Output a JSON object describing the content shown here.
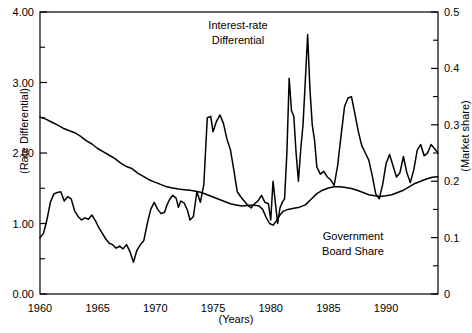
{
  "chart_data": {
    "type": "line",
    "title": "",
    "xlabel": "(Years)",
    "ylabel_left": "(Rate Differential)",
    "ylabel_right": "(Market share)",
    "xlim": [
      1960,
      1994.5
    ],
    "ylim_left": [
      0.0,
      4.0
    ],
    "ylim_right": [
      0.0,
      0.5
    ],
    "grid": false,
    "legend_position": "inline-annotations",
    "x_ticks": [
      "1960",
      "1965",
      "1970",
      "1975",
      "1980",
      "1985",
      "1990"
    ],
    "x_tick_values": [
      1960,
      1965,
      1970,
      1975,
      1980,
      1985,
      1990
    ],
    "y_ticks_left": [
      "0.00",
      "1.00",
      "2.00",
      "3.00",
      "4.00"
    ],
    "y_tick_values_left": [
      0.0,
      1.0,
      2.0,
      3.0,
      4.0
    ],
    "y_minor_ticks_left": [
      0.5,
      1.5,
      2.5,
      3.5
    ],
    "y_ticks_right": [
      "0",
      "0.1",
      "0.2",
      "0.3",
      "0.4",
      "0.5"
    ],
    "y_tick_values_right": [
      0.0,
      0.1,
      0.2,
      0.3,
      0.4,
      0.5
    ],
    "y_minor_ticks_right": [
      0.05,
      0.15,
      0.25,
      0.35,
      0.45
    ],
    "annotations": [
      {
        "name": "interest-rate-differential-label",
        "line1": "Interest-rate",
        "line2": "Differential"
      },
      {
        "name": "government-board-share-label",
        "line1": "Government",
        "line2": "Board Share"
      }
    ],
    "series": [
      {
        "name": "Interest-rate Differential",
        "axis": "left",
        "color": "#000000",
        "x": [
          1960.0,
          1960.3,
          1960.6,
          1960.9,
          1961.2,
          1961.5,
          1961.8,
          1962.1,
          1962.4,
          1962.7,
          1963.0,
          1963.3,
          1963.6,
          1963.9,
          1964.2,
          1964.5,
          1964.8,
          1965.1,
          1965.4,
          1965.7,
          1966.0,
          1966.3,
          1966.6,
          1966.9,
          1967.2,
          1967.5,
          1967.8,
          1968.1,
          1968.4,
          1968.7,
          1969.0,
          1969.3,
          1969.6,
          1969.9,
          1970.2,
          1970.5,
          1970.8,
          1971.0,
          1971.2,
          1971.5,
          1971.8,
          1972.0,
          1972.2,
          1972.5,
          1972.8,
          1973.0,
          1973.3,
          1973.6,
          1973.9,
          1974.2,
          1974.5,
          1974.8,
          1975.0,
          1975.3,
          1975.6,
          1975.9,
          1976.2,
          1976.5,
          1976.8,
          1977.1,
          1977.4,
          1977.7,
          1978.0,
          1978.3,
          1978.6,
          1978.9,
          1979.2,
          1979.5,
          1979.8,
          1980.0,
          1980.2,
          1980.4,
          1980.6,
          1980.8,
          1981.0,
          1981.2,
          1981.4,
          1981.6,
          1981.8,
          1982.0,
          1982.2,
          1982.4,
          1982.6,
          1982.8,
          1983.0,
          1983.2,
          1983.4,
          1983.6,
          1983.8,
          1984.0,
          1984.3,
          1984.6,
          1984.9,
          1985.2,
          1985.5,
          1985.8,
          1986.1,
          1986.4,
          1986.7,
          1987.0,
          1987.3,
          1987.6,
          1987.9,
          1988.2,
          1988.5,
          1988.8,
          1989.1,
          1989.4,
          1989.7,
          1990.0,
          1990.3,
          1990.6,
          1990.9,
          1991.2,
          1991.5,
          1991.8,
          1992.1,
          1992.4,
          1992.7,
          1993.0,
          1993.3,
          1993.6,
          1993.9,
          1994.2,
          1994.5
        ],
        "y": [
          0.8,
          0.86,
          1.05,
          1.3,
          1.42,
          1.44,
          1.45,
          1.32,
          1.38,
          1.35,
          1.18,
          1.1,
          1.05,
          1.08,
          1.06,
          1.12,
          1.04,
          0.94,
          0.86,
          0.78,
          0.72,
          0.7,
          0.65,
          0.68,
          0.64,
          0.7,
          0.6,
          0.45,
          0.62,
          0.7,
          0.76,
          1.0,
          1.2,
          1.3,
          1.2,
          1.14,
          1.16,
          1.26,
          1.33,
          1.4,
          1.36,
          1.23,
          1.32,
          1.29,
          1.18,
          1.05,
          1.1,
          1.45,
          1.3,
          1.55,
          2.5,
          2.52,
          2.3,
          2.45,
          2.54,
          2.42,
          2.2,
          2.05,
          1.76,
          1.45,
          1.38,
          1.32,
          1.26,
          1.22,
          1.28,
          1.32,
          1.4,
          1.3,
          1.28,
          1.05,
          1.6,
          1.3,
          1.0,
          1.22,
          1.3,
          1.35,
          2.0,
          3.06,
          2.6,
          2.52,
          2.0,
          1.6,
          2.05,
          2.4,
          3.03,
          3.68,
          2.9,
          2.4,
          2.18,
          1.8,
          1.7,
          1.74,
          1.66,
          1.62,
          1.54,
          1.82,
          2.25,
          2.66,
          2.78,
          2.8,
          2.55,
          2.3,
          2.1,
          2.0,
          1.9,
          1.68,
          1.42,
          1.35,
          1.55,
          1.85,
          1.98,
          1.82,
          1.66,
          1.72,
          1.95,
          1.72,
          1.58,
          1.76,
          2.04,
          2.12,
          1.96,
          2.0,
          2.12,
          2.06,
          2.0
        ]
      },
      {
        "name": "Government Board Share",
        "axis": "right",
        "color": "#000000",
        "x": [
          1960.0,
          1960.5,
          1961.0,
          1961.5,
          1962.0,
          1962.5,
          1963.0,
          1963.5,
          1964.0,
          1964.5,
          1965.0,
          1965.5,
          1966.0,
          1966.5,
          1967.0,
          1967.5,
          1968.0,
          1968.5,
          1969.0,
          1969.5,
          1970.0,
          1970.5,
          1971.0,
          1971.5,
          1972.0,
          1972.5,
          1973.0,
          1973.5,
          1974.0,
          1974.5,
          1975.0,
          1975.5,
          1976.0,
          1976.5,
          1977.0,
          1977.5,
          1978.0,
          1978.5,
          1979.0,
          1979.3,
          1979.6,
          1979.9,
          1980.2,
          1980.5,
          1980.8,
          1981.1,
          1981.5,
          1982.0,
          1982.5,
          1983.0,
          1983.5,
          1984.0,
          1984.5,
          1985.0,
          1985.5,
          1986.0,
          1986.5,
          1987.0,
          1987.5,
          1988.0,
          1988.5,
          1989.0,
          1989.5,
          1990.0,
          1990.5,
          1991.0,
          1991.5,
          1992.0,
          1992.5,
          1993.0,
          1993.5,
          1994.0,
          1994.5
        ],
        "y": [
          0.314,
          0.31,
          0.305,
          0.3,
          0.294,
          0.29,
          0.286,
          0.28,
          0.272,
          0.266,
          0.258,
          0.252,
          0.246,
          0.24,
          0.232,
          0.226,
          0.222,
          0.214,
          0.208,
          0.202,
          0.198,
          0.194,
          0.19,
          0.188,
          0.186,
          0.185,
          0.184,
          0.182,
          0.18,
          0.176,
          0.172,
          0.168,
          0.164,
          0.16,
          0.158,
          0.156,
          0.157,
          0.158,
          0.156,
          0.15,
          0.136,
          0.125,
          0.122,
          0.13,
          0.14,
          0.147,
          0.15,
          0.152,
          0.154,
          0.158,
          0.168,
          0.178,
          0.184,
          0.188,
          0.19,
          0.19,
          0.189,
          0.187,
          0.184,
          0.18,
          0.176,
          0.174,
          0.173,
          0.174,
          0.176,
          0.18,
          0.184,
          0.19,
          0.196,
          0.2,
          0.204,
          0.207,
          0.208
        ]
      }
    ]
  },
  "axes": {
    "left_label": "(Rate Differential)",
    "right_label": "(Market share)",
    "bottom_label": "(Years)"
  }
}
